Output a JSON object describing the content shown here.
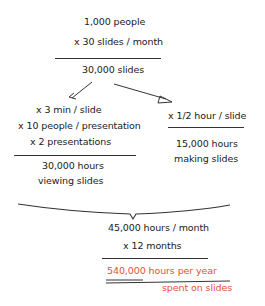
{
  "diagram": {
    "top": {
      "line1": "1,000 people",
      "line2": "x 30 slides / month",
      "result": "30,000 slides"
    },
    "left_branch": {
      "line1": "x 3 min / slide",
      "line2": "x 10 people / presentation",
      "line3": "x 2 presentations",
      "result1": "30,000 hours",
      "result2": "viewing slides"
    },
    "right_branch": {
      "line1": "x 1/2 hour / slide",
      "result1": "15,000 hours",
      "result2": "making slides"
    },
    "total": {
      "line1": "45,000 hours / month",
      "line2": "x 12 months",
      "result1": "540,000 hours per year",
      "result2": "spent on slides"
    },
    "colors": {
      "ink": "#1a1a1a",
      "highlight": "#e0523a"
    }
  }
}
